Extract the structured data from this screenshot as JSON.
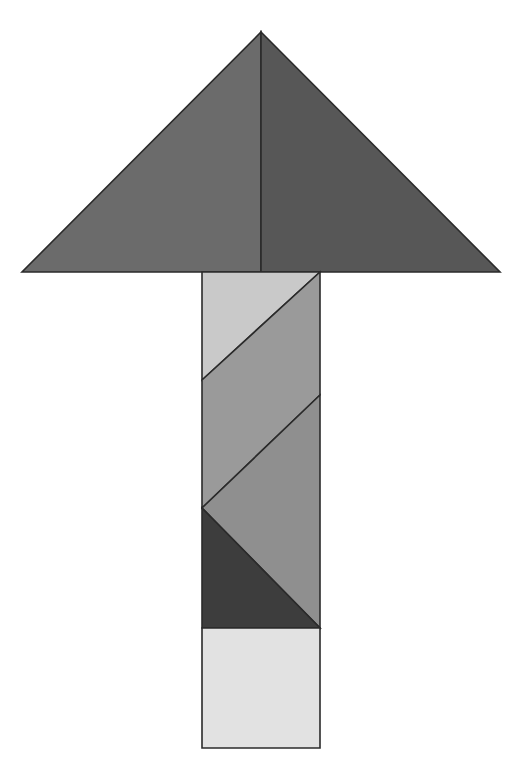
{
  "figure": {
    "title": "Tangram Arrow Figure",
    "canvas": {
      "width": 528,
      "height": 773,
      "background_color": "#ffffff"
    },
    "palette": {
      "head_left": "#6b6b6b",
      "head_right": "#575757",
      "shaft_light": "#c9c9c9",
      "shaft_medium": "#9a9a9a",
      "shaft_mid": "#8f8f8f",
      "shaft_dark": "#3d3d3d",
      "base_square": "#e2e2e2",
      "outline": "#2b2b2b"
    },
    "stroke_width": 1.6,
    "pieces": [
      {
        "id": "head-left-triangle",
        "name": "arrow-head-left-triangle",
        "shape": "triangle",
        "fill": "#6b6b6b",
        "points": "261,32 261,272 22,272"
      },
      {
        "id": "head-right-triangle",
        "name": "arrow-head-right-triangle",
        "shape": "triangle",
        "fill": "#575757",
        "points": "261,32 500,272 261,272"
      },
      {
        "id": "shaft-upper-light-triangle",
        "name": "shaft-upper-light-triangle",
        "shape": "triangle",
        "fill": "#c9c9c9",
        "points": "202,272 320,272 202,380"
      },
      {
        "id": "shaft-upper-parallelogram",
        "name": "shaft-upper-parallelogram",
        "shape": "parallelogram",
        "fill": "#9a9a9a",
        "points": "320,272 320,395 202,508 202,380"
      },
      {
        "id": "shaft-lower-medium-triangle",
        "name": "shaft-lower-medium-triangle",
        "shape": "triangle",
        "fill": "#8f8f8f",
        "points": "320,395 320,628 202,508"
      },
      {
        "id": "shaft-dark-triangle",
        "name": "shaft-dark-triangle",
        "shape": "triangle",
        "fill": "#3d3d3d",
        "points": "202,508 320,628 202,628"
      },
      {
        "id": "base-square",
        "name": "base-square",
        "shape": "square",
        "fill": "#e2e2e2",
        "points": "202,628 320,628 320,748 202,748"
      }
    ],
    "geometry_notes": {
      "head_apex": "261,32",
      "head_left_vertex": "22,272",
      "head_right_vertex": "500,272",
      "shaft_left_x": 202,
      "shaft_right_x": 320,
      "shaft_top_y": 272,
      "shaft_bottom_y": 748,
      "base_square_top_y": 628,
      "piece_count": 7
    }
  }
}
